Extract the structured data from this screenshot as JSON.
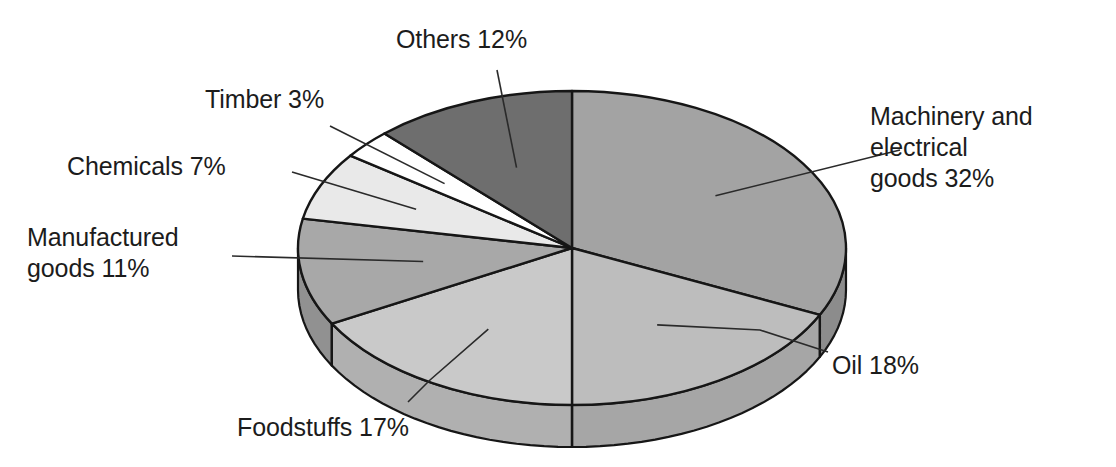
{
  "chart_data": {
    "type": "pie",
    "title": "",
    "subtitle": "",
    "xlabel": "",
    "ylabel": "",
    "legend_position": "none",
    "grid": false,
    "three_d": true,
    "units": "percent",
    "start_angle_deg": 0,
    "direction": "clockwise",
    "categories": [
      "Machinery and electrical goods",
      "Oil",
      "Foodstuffs",
      "Manufactured goods",
      "Chemicals",
      "Timber",
      "Others"
    ],
    "values": [
      32,
      18,
      17,
      11,
      7,
      3,
      12
    ],
    "slices": [
      {
        "name": "Machinery and electrical goods",
        "label": "Machinery and\nelectrical\ngoods 32%",
        "value": 32,
        "value_text": "32%",
        "color": "#a3a3a3",
        "side_color": "#8c8c8c"
      },
      {
        "name": "Oil",
        "label": "Oil 18%",
        "value": 18,
        "value_text": "18%",
        "color": "#bdbdbd",
        "side_color": "#a6a6a6"
      },
      {
        "name": "Foodstuffs",
        "label": "Foodstuffs 17%",
        "value": 17,
        "value_text": "17%",
        "color": "#c9c9c9",
        "side_color": "#b0b0b0"
      },
      {
        "name": "Manufactured goods",
        "label": "Manufactured\ngoods 11%",
        "value": 11,
        "value_text": "11%",
        "color": "#a8a8a8",
        "side_color": "#919191"
      },
      {
        "name": "Chemicals",
        "label": "Chemicals 7%",
        "value": 7,
        "value_text": "7%",
        "color": "#e9e9e9",
        "side_color": "#cfcfcf"
      },
      {
        "name": "Timber",
        "label": "Timber 3%",
        "value": 3,
        "value_text": "3%",
        "color": "#ffffff",
        "side_color": "#eeeeee"
      },
      {
        "name": "Others",
        "label": "Others 12%",
        "value": 12,
        "value_text": "12%",
        "color": "#6e6e6e",
        "side_color": "#5a5a5a"
      }
    ],
    "colors": {
      "outline": "#161616",
      "leader_line": "#2a2a2a",
      "background": "#ffffff",
      "text": "#1c1c1c"
    },
    "geometry": {
      "center_x": 572,
      "center_y": 248,
      "radius_x": 274,
      "radius_y": 157,
      "depth": 42
    }
  }
}
